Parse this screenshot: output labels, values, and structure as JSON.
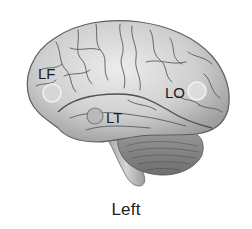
{
  "figure": {
    "title": "Left",
    "view": "lateral view of left brain hemisphere",
    "colors": {
      "cortex": "#c9c9c9",
      "cortex_highlight": "#e6e6e6",
      "sulci": "#5a5a5a",
      "cerebellum": "#8a8a8a",
      "brainstem": "#b8b8b8",
      "marker_fill": "#d8d8d8",
      "marker_stroke": "#f4f4f4",
      "text": "#1a1a1a"
    },
    "markers": [
      {
        "id": "LF",
        "label": "LF",
        "cx": 52,
        "cy": 93,
        "r": 9,
        "label_x": 38,
        "label_y": 79
      },
      {
        "id": "LT",
        "label": "LT",
        "cx": 95,
        "cy": 116,
        "r": 8,
        "label_x": 106,
        "label_y": 123
      },
      {
        "id": "LO",
        "label": "LO",
        "cx": 197,
        "cy": 91,
        "r": 9,
        "label_x": 165,
        "label_y": 98
      }
    ]
  }
}
